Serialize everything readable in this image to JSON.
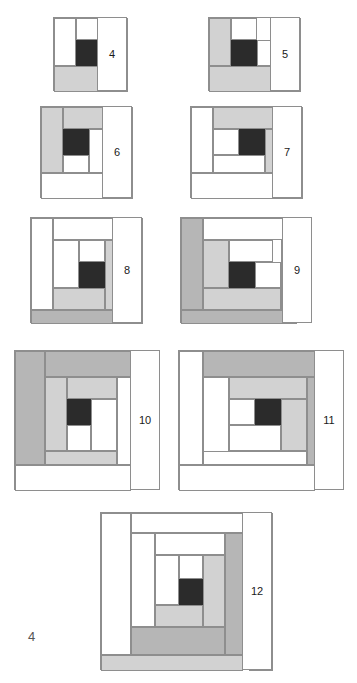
{
  "document": {
    "page_number": "4",
    "page_number_position": {
      "x": 28,
      "y": 629
    },
    "canvas": {
      "width": 357,
      "height": 683
    },
    "background": "#ffffff"
  },
  "palette": {
    "white": "#ffffff",
    "light_gray": "#d2d2d2",
    "medium_gray": "#b6b6b6",
    "black": "#262626",
    "outline": "#8e8e8e",
    "label_text": "#1a1a1a",
    "page_number_text": "#555555"
  },
  "figure": {
    "type": "log-cabin-quilt-block-series",
    "block_count": 9
  },
  "blocks": [
    {
      "number": "4",
      "x": 53,
      "y": 17,
      "w": 74,
      "h": 74,
      "label": {
        "x": 97,
        "y": 17,
        "w": 30,
        "h": 74
      },
      "patches": [
        {
          "name": "center-square",
          "shade": "black",
          "x": 22,
          "y": 22,
          "w": 26,
          "h": 26
        },
        {
          "name": "log-1",
          "shade": "white",
          "x": 22,
          "y": 0,
          "w": 26,
          "h": 22
        },
        {
          "name": "log-2",
          "shade": "white",
          "x": 0,
          "y": 0,
          "w": 22,
          "h": 48
        },
        {
          "name": "log-3",
          "shade": "light_gray",
          "x": 0,
          "y": 48,
          "w": 48,
          "h": 26
        },
        {
          "name": "log-4",
          "shade": "light_gray",
          "x": 48,
          "y": 0,
          "w": 26,
          "h": 74
        }
      ]
    },
    {
      "number": "5",
      "x": 208,
      "y": 17,
      "w": 92,
      "h": 74,
      "label": {
        "x": 270,
        "y": 17,
        "w": 30,
        "h": 74
      },
      "patches": [
        {
          "name": "center-square",
          "shade": "black",
          "x": 22,
          "y": 22,
          "w": 26,
          "h": 26
        },
        {
          "name": "log-1",
          "shade": "white",
          "x": 22,
          "y": 0,
          "w": 26,
          "h": 22
        },
        {
          "name": "log-2",
          "shade": "white",
          "x": 48,
          "y": 22,
          "w": 26,
          "h": 26
        },
        {
          "name": "log-3",
          "shade": "light_gray",
          "x": 0,
          "y": 0,
          "w": 22,
          "h": 48
        },
        {
          "name": "log-4",
          "shade": "light_gray",
          "x": 0,
          "y": 48,
          "w": 74,
          "h": 26
        },
        {
          "name": "log-5",
          "shade": "white",
          "x": 74,
          "y": 0,
          "w": 18,
          "h": 74
        }
      ]
    },
    {
      "number": "6",
      "x": 40,
      "y": 106,
      "w": 92,
      "h": 92,
      "label": {
        "x": 102,
        "y": 106,
        "w": 30,
        "h": 92
      },
      "patches": [
        {
          "name": "center-square",
          "shade": "black",
          "x": 22,
          "y": 22,
          "w": 26,
          "h": 26
        },
        {
          "name": "log-1",
          "shade": "white",
          "x": 48,
          "y": 22,
          "w": 26,
          "h": 44
        },
        {
          "name": "log-2",
          "shade": "white",
          "x": 22,
          "y": 48,
          "w": 26,
          "h": 18
        },
        {
          "name": "log-3",
          "shade": "light_gray",
          "x": 22,
          "y": 0,
          "w": 52,
          "h": 22
        },
        {
          "name": "log-4",
          "shade": "light_gray",
          "x": 0,
          "y": 0,
          "w": 22,
          "h": 66
        },
        {
          "name": "log-5",
          "shade": "white",
          "x": 0,
          "y": 66,
          "w": 92,
          "h": 26
        },
        {
          "name": "log-6",
          "shade": "white",
          "x": 74,
          "y": 0,
          "w": 18,
          "h": 66
        }
      ]
    },
    {
      "number": "7",
      "x": 190,
      "y": 106,
      "w": 112,
      "h": 92,
      "label": {
        "x": 272,
        "y": 106,
        "w": 30,
        "h": 92
      },
      "patches": [
        {
          "name": "center-square",
          "shade": "black",
          "x": 48,
          "y": 22,
          "w": 26,
          "h": 26
        },
        {
          "name": "log-1",
          "shade": "white",
          "x": 22,
          "y": 22,
          "w": 26,
          "h": 26
        },
        {
          "name": "log-2",
          "shade": "white",
          "x": 22,
          "y": 48,
          "w": 52,
          "h": 18
        },
        {
          "name": "log-3",
          "shade": "light_gray",
          "x": 22,
          "y": 0,
          "w": 74,
          "h": 22
        },
        {
          "name": "log-4",
          "shade": "light_gray",
          "x": 74,
          "y": 22,
          "w": 22,
          "h": 44
        },
        {
          "name": "log-5",
          "shade": "white",
          "x": 0,
          "y": 0,
          "w": 22,
          "h": 66
        },
        {
          "name": "log-6",
          "shade": "white",
          "x": 0,
          "y": 66,
          "w": 96,
          "h": 26
        },
        {
          "name": "log-7",
          "shade": "medium_gray",
          "x": 96,
          "y": 0,
          "w": 16,
          "h": 92
        }
      ]
    },
    {
      "number": "8",
      "x": 30,
      "y": 217,
      "w": 112,
      "h": 106,
      "label": {
        "x": 112,
        "y": 217,
        "w": 30,
        "h": 106
      },
      "patches": [
        {
          "name": "center-square",
          "shade": "black",
          "x": 48,
          "y": 44,
          "w": 26,
          "h": 26
        },
        {
          "name": "log-1",
          "shade": "white",
          "x": 48,
          "y": 22,
          "w": 26,
          "h": 22
        },
        {
          "name": "log-2",
          "shade": "white",
          "x": 22,
          "y": 22,
          "w": 26,
          "h": 48
        },
        {
          "name": "log-3",
          "shade": "light_gray",
          "x": 22,
          "y": 70,
          "w": 52,
          "h": 22
        },
        {
          "name": "log-4",
          "shade": "light_gray",
          "x": 74,
          "y": 22,
          "w": 22,
          "h": 70
        },
        {
          "name": "log-5",
          "shade": "white",
          "x": 22,
          "y": 0,
          "w": 74,
          "h": 22
        },
        {
          "name": "log-6",
          "shade": "white",
          "x": 0,
          "y": 0,
          "w": 22,
          "h": 92
        },
        {
          "name": "log-7",
          "shade": "medium_gray",
          "x": 0,
          "y": 92,
          "w": 96,
          "h": 14
        },
        {
          "name": "log-8",
          "shade": "medium_gray",
          "x": 96,
          "y": 0,
          "w": 16,
          "h": 106
        }
      ]
    },
    {
      "number": "9",
      "x": 180,
      "y": 217,
      "w": 132,
      "h": 106,
      "label": {
        "x": 282,
        "y": 217,
        "w": 30,
        "h": 106
      },
      "patches": [
        {
          "name": "center-square",
          "shade": "black",
          "x": 48,
          "y": 44,
          "w": 26,
          "h": 26
        },
        {
          "name": "log-1",
          "shade": "white",
          "x": 48,
          "y": 22,
          "w": 44,
          "h": 22
        },
        {
          "name": "log-2",
          "shade": "white",
          "x": 74,
          "y": 44,
          "w": 26,
          "h": 26
        },
        {
          "name": "log-3",
          "shade": "light_gray",
          "x": 22,
          "y": 22,
          "w": 26,
          "h": 48
        },
        {
          "name": "log-4",
          "shade": "light_gray",
          "x": 22,
          "y": 70,
          "w": 78,
          "h": 22
        },
        {
          "name": "log-5",
          "shade": "white",
          "x": 22,
          "y": 0,
          "w": 94,
          "h": 22
        },
        {
          "name": "log-6",
          "shade": "medium_gray",
          "x": 0,
          "y": 0,
          "w": 22,
          "h": 92
        },
        {
          "name": "log-7",
          "shade": "medium_gray",
          "x": 0,
          "y": 92,
          "w": 116,
          "h": 14
        },
        {
          "name": "log-8",
          "shade": "white",
          "x": 100,
          "y": 22,
          "w": 16,
          "h": 70
        }
      ]
    },
    {
      "number": "10",
      "x": 14,
      "y": 350,
      "w": 146,
      "h": 140,
      "label": {
        "x": 130,
        "y": 350,
        "w": 30,
        "h": 140
      },
      "patches": [
        {
          "name": "center-square",
          "shade": "black",
          "x": 52,
          "y": 48,
          "w": 24,
          "h": 26
        },
        {
          "name": "log-1",
          "shade": "white",
          "x": 52,
          "y": 74,
          "w": 24,
          "h": 26
        },
        {
          "name": "log-2",
          "shade": "white",
          "x": 76,
          "y": 48,
          "w": 26,
          "h": 52
        },
        {
          "name": "log-3",
          "shade": "light_gray",
          "x": 52,
          "y": 26,
          "w": 50,
          "h": 22
        },
        {
          "name": "log-4",
          "shade": "light_gray",
          "x": 30,
          "y": 26,
          "w": 22,
          "h": 74
        },
        {
          "name": "log-5",
          "shade": "light_gray",
          "x": 30,
          "y": 100,
          "w": 72,
          "h": 14
        },
        {
          "name": "log-6",
          "shade": "white",
          "x": 102,
          "y": 26,
          "w": 14,
          "h": 88
        },
        {
          "name": "log-7",
          "shade": "medium_gray",
          "x": 30,
          "y": 0,
          "w": 86,
          "h": 26
        },
        {
          "name": "log-8",
          "shade": "medium_gray",
          "x": 0,
          "y": 0,
          "w": 30,
          "h": 114
        },
        {
          "name": "log-9",
          "shade": "white",
          "x": 0,
          "y": 114,
          "w": 116,
          "h": 26
        }
      ]
    },
    {
      "number": "11",
      "x": 178,
      "y": 350,
      "w": 166,
      "h": 140,
      "label": {
        "x": 314,
        "y": 350,
        "w": 30,
        "h": 140
      },
      "patches": [
        {
          "name": "center-square",
          "shade": "black",
          "x": 76,
          "y": 48,
          "w": 26,
          "h": 26
        },
        {
          "name": "log-1",
          "shade": "white",
          "x": 50,
          "y": 48,
          "w": 26,
          "h": 26
        },
        {
          "name": "log-2",
          "shade": "white",
          "x": 50,
          "y": 74,
          "w": 52,
          "h": 26
        },
        {
          "name": "log-3",
          "shade": "light_gray",
          "x": 50,
          "y": 26,
          "w": 78,
          "h": 22
        },
        {
          "name": "log-4",
          "shade": "light_gray",
          "x": 102,
          "y": 48,
          "w": 26,
          "h": 52
        },
        {
          "name": "log-5",
          "shade": "white",
          "x": 24,
          "y": 26,
          "w": 26,
          "h": 88
        },
        {
          "name": "log-6",
          "shade": "white",
          "x": 24,
          "y": 100,
          "w": 104,
          "h": 14
        },
        {
          "name": "log-7",
          "shade": "medium_gray",
          "x": 24,
          "y": 0,
          "w": 112,
          "h": 26
        },
        {
          "name": "log-8",
          "shade": "medium_gray",
          "x": 128,
          "y": 26,
          "w": 8,
          "h": 88
        },
        {
          "name": "log-9",
          "shade": "white",
          "x": 0,
          "y": 0,
          "w": 24,
          "h": 114
        },
        {
          "name": "log-10",
          "shade": "white",
          "x": 0,
          "y": 114,
          "w": 136,
          "h": 26
        }
      ]
    },
    {
      "number": "12",
      "x": 100,
      "y": 512,
      "w": 172,
      "h": 158,
      "label": {
        "x": 242,
        "y": 512,
        "w": 30,
        "h": 158
      },
      "patches": [
        {
          "name": "center-square",
          "shade": "black",
          "x": 78,
          "y": 66,
          "w": 24,
          "h": 26
        },
        {
          "name": "log-1",
          "shade": "white",
          "x": 78,
          "y": 42,
          "w": 24,
          "h": 24
        },
        {
          "name": "log-2",
          "shade": "white",
          "x": 54,
          "y": 42,
          "w": 24,
          "h": 50
        },
        {
          "name": "log-3",
          "shade": "light_gray",
          "x": 54,
          "y": 92,
          "w": 48,
          "h": 22
        },
        {
          "name": "log-4",
          "shade": "light_gray",
          "x": 102,
          "y": 42,
          "w": 22,
          "h": 72
        },
        {
          "name": "log-5",
          "shade": "white",
          "x": 54,
          "y": 20,
          "w": 70,
          "h": 22
        },
        {
          "name": "log-6",
          "shade": "white",
          "x": 30,
          "y": 20,
          "w": 24,
          "h": 94
        },
        {
          "name": "log-7",
          "shade": "medium_gray",
          "x": 30,
          "y": 114,
          "w": 94,
          "h": 28
        },
        {
          "name": "log-8",
          "shade": "medium_gray",
          "x": 124,
          "y": 20,
          "w": 24,
          "h": 122
        },
        {
          "name": "log-9",
          "shade": "white",
          "x": 30,
          "y": 0,
          "w": 118,
          "h": 20
        },
        {
          "name": "log-10",
          "shade": "white",
          "x": 0,
          "y": 0,
          "w": 30,
          "h": 142
        },
        {
          "name": "log-11",
          "shade": "light_gray",
          "x": 0,
          "y": 142,
          "w": 142,
          "h": 16
        },
        {
          "name": "log-12",
          "shade": "light_gray",
          "x": 148,
          "y": 0,
          "w": 24,
          "h": 158
        }
      ]
    }
  ]
}
